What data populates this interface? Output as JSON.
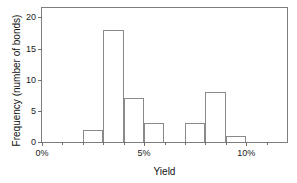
{
  "chart_data": {
    "type": "bar",
    "title": "",
    "subtitle": "",
    "xlabel": "Yield",
    "ylabel": "Frequency (number of bonds)",
    "xlim": [
      0,
      12
    ],
    "ylim": [
      0,
      21.5
    ],
    "grid": false,
    "legend": null,
    "bin_width": 1,
    "x_unit": "%",
    "categories": [
      "0%-1%",
      "1%-2%",
      "2%-3%",
      "3%-4%",
      "4%-5%",
      "5%-6%",
      "6%-7%",
      "7%-8%",
      "8%-9%",
      "9%-10%",
      "10%-11%",
      "11%-12%"
    ],
    "bin_starts": [
      0,
      1,
      2,
      3,
      4,
      5,
      6,
      7,
      8,
      9,
      10,
      11
    ],
    "values": [
      0,
      0,
      2,
      18,
      7,
      3,
      0,
      3,
      8,
      1,
      0,
      0
    ],
    "xticks": [
      0,
      5,
      10
    ],
    "xtick_labels": [
      "0%",
      "5%",
      "10%"
    ],
    "xminor_ticks": [
      1,
      2,
      3,
      4,
      6,
      7,
      8,
      9,
      11
    ],
    "yticks": [
      0,
      5,
      10,
      15,
      20
    ],
    "ytick_labels": [
      "0",
      "5",
      "10",
      "15",
      "20"
    ],
    "colors": {
      "bar_stroke": "#8a8a8a",
      "bar_fill": "transparent",
      "frame": "#7d7d7d",
      "text": "#1a1a1a",
      "background": "#ffffff"
    }
  }
}
